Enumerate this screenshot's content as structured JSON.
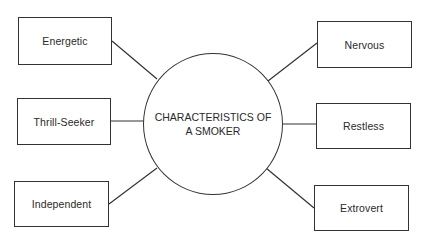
{
  "diagram": {
    "center": {
      "line1": "CHARACTERISTICS OF",
      "line2": "A SMOKER"
    },
    "left_nodes": [
      {
        "label": "Energetic"
      },
      {
        "label": "Thrill-Seeker"
      },
      {
        "label": "Independent"
      }
    ],
    "right_nodes": [
      {
        "label": "Nervous"
      },
      {
        "label": "Restless"
      },
      {
        "label": "Extrovert"
      }
    ],
    "colors": {
      "line": "#333333",
      "text": "#2a2a2a",
      "background": "#ffffff"
    }
  }
}
